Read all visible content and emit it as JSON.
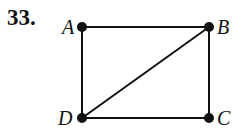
{
  "problem": {
    "number": "33."
  },
  "graph": {
    "vertices": [
      {
        "id": "A",
        "label": "A",
        "x": 82,
        "y": 27,
        "lx": 62,
        "ly": 34
      },
      {
        "id": "B",
        "label": "B",
        "x": 209,
        "y": 27,
        "lx": 217,
        "ly": 34
      },
      {
        "id": "C",
        "label": "C",
        "x": 209,
        "y": 118,
        "lx": 217,
        "ly": 125
      },
      {
        "id": "D",
        "label": "D",
        "x": 82,
        "y": 118,
        "lx": 58,
        "ly": 125
      }
    ],
    "edges": [
      [
        "A",
        "B"
      ],
      [
        "A",
        "D"
      ],
      [
        "B",
        "C"
      ],
      [
        "D",
        "C"
      ],
      [
        "D",
        "B"
      ]
    ],
    "color": "#111111"
  }
}
